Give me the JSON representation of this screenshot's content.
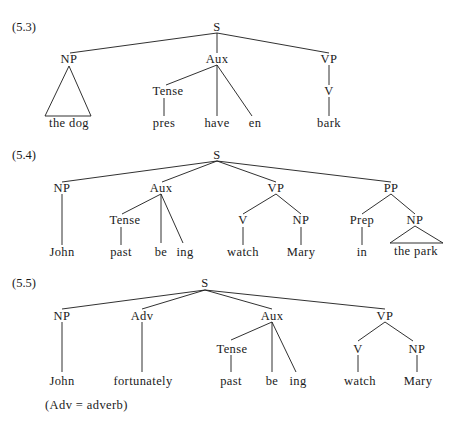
{
  "examples": [
    {
      "number": "(5.3)",
      "nodes": {
        "S": "S",
        "NP": "NP",
        "Aux": "Aux",
        "VP": "VP",
        "Tense": "Tense",
        "V": "V",
        "the_dog": "the dog",
        "pres": "pres",
        "have": "have",
        "en": "en",
        "bark": "bark"
      }
    },
    {
      "number": "(5.4)",
      "nodes": {
        "S": "S",
        "NP": "NP",
        "Aux": "Aux",
        "VP": "VP",
        "PP": "PP",
        "Tense": "Tense",
        "V": "V",
        "NP2": "NP",
        "Prep": "Prep",
        "NP3": "NP",
        "John": "John",
        "past": "past",
        "be": "be",
        "ing": "ing",
        "watch": "watch",
        "Mary": "Mary",
        "in": "in",
        "the_park": "the park"
      }
    },
    {
      "number": "(5.5)",
      "nodes": {
        "S": "S",
        "NP": "NP",
        "Adv": "Adv",
        "Aux": "Aux",
        "VP": "VP",
        "Tense": "Tense",
        "V": "V",
        "NP2": "NP",
        "John": "John",
        "fortunately": "fortunately",
        "past": "past",
        "be": "be",
        "ing": "ing",
        "watch": "watch",
        "Mary": "Mary"
      },
      "note": "(Adv = adverb)"
    }
  ],
  "colors": {
    "ink": "#1a1a1a",
    "background": "#ffffff"
  }
}
